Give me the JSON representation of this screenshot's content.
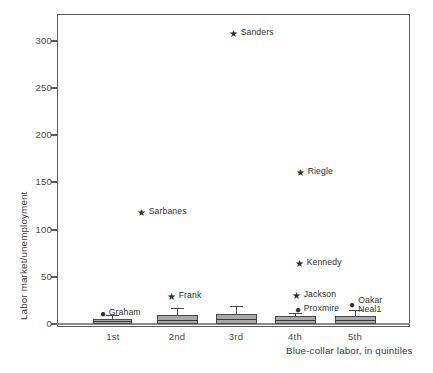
{
  "chart_data": {
    "type": "box",
    "title": "",
    "xlabel": "Blue-collar labor, in quintiles",
    "ylabel": "Labor market/unemployment",
    "categories": [
      "1st",
      "2nd",
      "3rd",
      "4th",
      "5th"
    ],
    "ylim": [
      0,
      330
    ],
    "yticks": [
      0,
      50,
      100,
      150,
      200,
      250,
      300
    ],
    "ytick_labels": [
      "0",
      "50",
      "100",
      "150",
      "200",
      "250",
      "300"
    ],
    "grid": false,
    "legend": "none",
    "boxes": [
      {
        "category": "1st",
        "whisker_low": 0,
        "q1": 1,
        "median": 2,
        "q3": 4,
        "whisker_high": 8
      },
      {
        "category": "2nd",
        "whisker_low": 0,
        "q1": 1,
        "median": 4,
        "q3": 9,
        "whisker_high": 16
      },
      {
        "category": "3rd",
        "whisker_low": 0,
        "q1": 1,
        "median": 5,
        "q3": 10,
        "whisker_high": 18
      },
      {
        "category": "4th",
        "whisker_low": 0,
        "q1": 1,
        "median": 4,
        "q3": 8,
        "whisker_high": 11
      },
      {
        "category": "5th",
        "whisker_low": 0,
        "q1": 1,
        "median": 3,
        "q3": 7,
        "whisker_high": 14
      }
    ],
    "outliers": [
      {
        "category": "2nd",
        "label": "Frank",
        "value": 29,
        "marker": "star"
      },
      {
        "category": "2nd",
        "label": "Sarbanes",
        "value": 119,
        "marker": "star"
      },
      {
        "category": "3rd",
        "label": "Sanders",
        "value": 311,
        "marker": "star"
      },
      {
        "category": "4th",
        "label": "Jackson",
        "value": 30,
        "marker": "star"
      },
      {
        "category": "4th",
        "label": "Kennedy",
        "value": 65,
        "marker": "star"
      },
      {
        "category": "4th",
        "label": "Riegle",
        "value": 163,
        "marker": "star"
      },
      {
        "category": "1st",
        "label": "Graham",
        "value": 13,
        "marker": "dot"
      },
      {
        "category": "4th",
        "label": "Proxmire",
        "value": 17,
        "marker": "dot"
      },
      {
        "category": "5th",
        "label": "Oakar\nNeal1",
        "value": 23,
        "marker": "dot"
      }
    ],
    "marker_glyphs": {
      "star": "★",
      "dot": "●"
    }
  },
  "caption": {
    "text": ""
  }
}
